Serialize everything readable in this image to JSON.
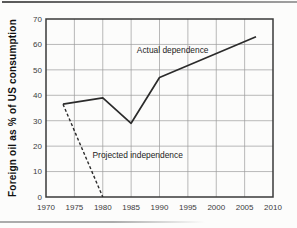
{
  "chart_data": {
    "type": "line",
    "title": "",
    "ylabel": "Foreign oil as % of US consumption",
    "xlabel": "",
    "xlim": [
      1970,
      2010
    ],
    "ylim": [
      0,
      70
    ],
    "x_ticks": [
      1970,
      1975,
      1980,
      1985,
      1990,
      1995,
      2000,
      2005,
      2010
    ],
    "y_ticks": [
      0,
      10,
      20,
      30,
      40,
      50,
      60,
      70
    ],
    "grid": true,
    "legend_position": "inline-annotations",
    "series": [
      {
        "name": "Actual dependence",
        "style": "solid",
        "color": "#2b2b2b",
        "x": [
          1973,
          1980,
          1985,
          1990,
          2007
        ],
        "values": [
          36.5,
          39,
          29,
          47,
          63
        ],
        "label": {
          "text": "Actual dependence",
          "anchor_x": 1986,
          "anchor_y": 58
        }
      },
      {
        "name": "Projected independence",
        "style": "dashed",
        "color": "#2b2b2b",
        "x": [
          1973,
          1980
        ],
        "values": [
          36.5,
          0
        ],
        "label": {
          "text": "Projected independence",
          "anchor_x": 1978.2,
          "anchor_y": 16.5
        }
      }
    ],
    "colors": {
      "grid": "#9b9b9b",
      "border": "#3a3a3a",
      "tick_text": "#3b3b3b",
      "line": "#2b2b2b"
    }
  }
}
